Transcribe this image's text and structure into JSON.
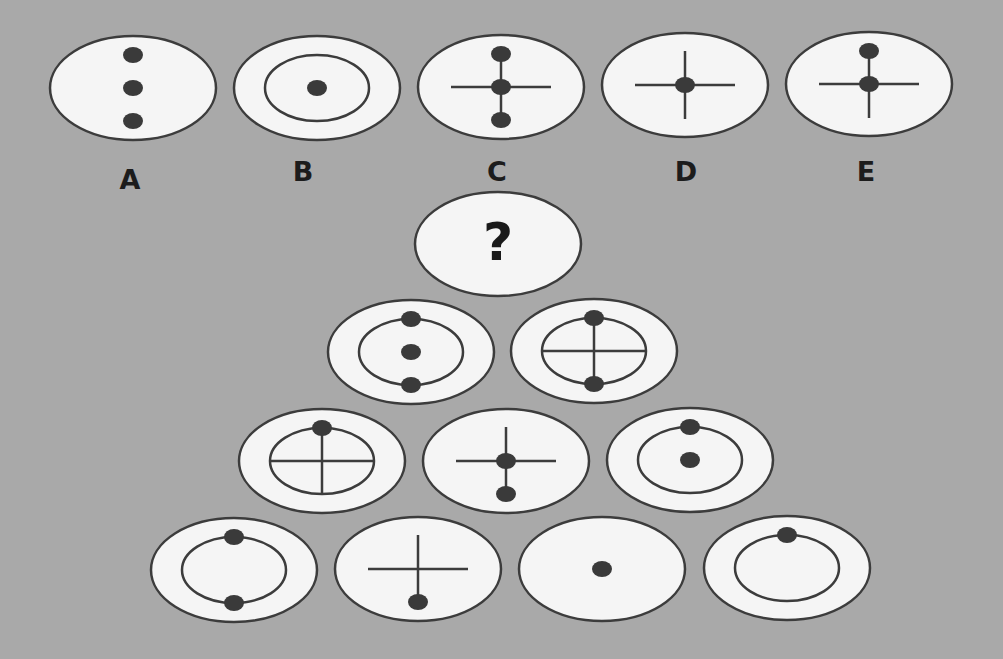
{
  "puzzle": {
    "colors": {
      "background": "#a9a9a9",
      "ellipse_fill": "#f5f5f5",
      "stroke": "#3c3c3c",
      "dot": "#3a3a3a"
    },
    "answer_options": [
      {
        "label": "A",
        "cx": 133,
        "cy": 88,
        "elements": [
          "dot-top",
          "dot-center",
          "dot-bottom"
        ]
      },
      {
        "label": "B",
        "cx": 317,
        "cy": 88,
        "elements": [
          "inner-ring",
          "dot-center"
        ]
      },
      {
        "label": "C",
        "cx": 501,
        "cy": 87,
        "elements": [
          "h-line",
          "v-line",
          "dot-top",
          "dot-center",
          "dot-bottom"
        ]
      },
      {
        "label": "D",
        "cx": 685,
        "cy": 85,
        "elements": [
          "h-line",
          "v-line",
          "dot-center"
        ]
      },
      {
        "label": "E",
        "cx": 869,
        "cy": 84,
        "elements": [
          "h-line",
          "v-line",
          "dot-top",
          "dot-center"
        ]
      }
    ],
    "question": {
      "text": "?",
      "cx": 498,
      "cy": 244
    },
    "pyramid": [
      [
        {
          "cx": 411,
          "cy": 352,
          "elements": [
            "inner-ring",
            "dot-top",
            "dot-center",
            "dot-bottom"
          ]
        },
        {
          "cx": 594,
          "cy": 351,
          "elements": [
            "inner-ring",
            "h-line",
            "v-line",
            "dot-top",
            "dot-bottom"
          ]
        }
      ],
      [
        {
          "cx": 322,
          "cy": 461,
          "elements": [
            "inner-ring",
            "h-line",
            "v-line",
            "dot-top"
          ]
        },
        {
          "cx": 506,
          "cy": 461,
          "elements": [
            "h-line",
            "v-line",
            "dot-center",
            "dot-bottom"
          ]
        },
        {
          "cx": 690,
          "cy": 460,
          "elements": [
            "inner-ring",
            "dot-top",
            "dot-center"
          ]
        }
      ],
      [
        {
          "cx": 234,
          "cy": 570,
          "elements": [
            "inner-ring",
            "dot-top",
            "dot-bottom"
          ]
        },
        {
          "cx": 418,
          "cy": 569,
          "elements": [
            "h-line",
            "v-line",
            "dot-bottom"
          ]
        },
        {
          "cx": 602,
          "cy": 569,
          "elements": [
            "dot-center"
          ]
        },
        {
          "cx": 787,
          "cy": 568,
          "elements": [
            "inner-ring",
            "dot-top"
          ]
        }
      ]
    ]
  }
}
